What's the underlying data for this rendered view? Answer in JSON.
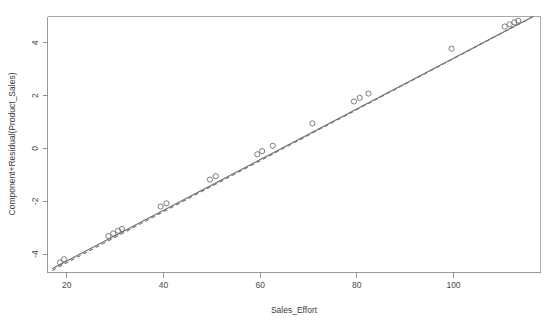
{
  "figure": {
    "background_color": "#ffffff",
    "point_color": "#6f6f6f",
    "line_color": "#6b6b6b",
    "smooth_color": "#8d6a6a",
    "axis_color": "#9a9a9a"
  },
  "chart_data": {
    "type": "scatter",
    "title": "",
    "xlabel": "Sales_Effort",
    "ylabel": "Component+Residual(Product_Sales)",
    "xlim": [
      16,
      118
    ],
    "ylim": [
      -4.7,
      5.0
    ],
    "xticks": [
      20,
      40,
      60,
      80,
      100
    ],
    "xtick_labels": [
      "20",
      "40",
      "60",
      "80",
      "100"
    ],
    "yticks": [
      -4,
      -2,
      0,
      2,
      4
    ],
    "ytick_labels": [
      "-4",
      "-2",
      "0",
      "2",
      "4"
    ],
    "grid": false,
    "legend": false,
    "marker": "open-circle",
    "x": [
      18.6,
      19.4,
      28.6,
      29.6,
      30.6,
      31.4,
      39.4,
      40.6,
      49.6,
      50.8,
      59.4,
      60.4,
      62.6,
      70.8,
      79.4,
      80.6,
      82.4,
      99.6,
      110.6,
      111.6,
      112.6,
      113.4
    ],
    "y": [
      -4.32,
      -4.2,
      -3.32,
      -3.22,
      -3.12,
      -3.05,
      -2.2,
      -2.08,
      -1.18,
      -1.05,
      -0.22,
      -0.1,
      0.1,
      0.95,
      1.78,
      1.92,
      2.08,
      3.78,
      4.62,
      4.7,
      4.78,
      4.84
    ],
    "series": [
      {
        "name": "component-line",
        "type": "line",
        "style": "solid",
        "x": [
          17.0,
          116.5
        ],
        "y": [
          -4.55,
          5.0
        ]
      },
      {
        "name": "residual-smoother",
        "type": "line",
        "style": "dashed",
        "x": [
          17.0,
          116.5
        ],
        "y": [
          -4.62,
          5.0
        ]
      }
    ]
  }
}
